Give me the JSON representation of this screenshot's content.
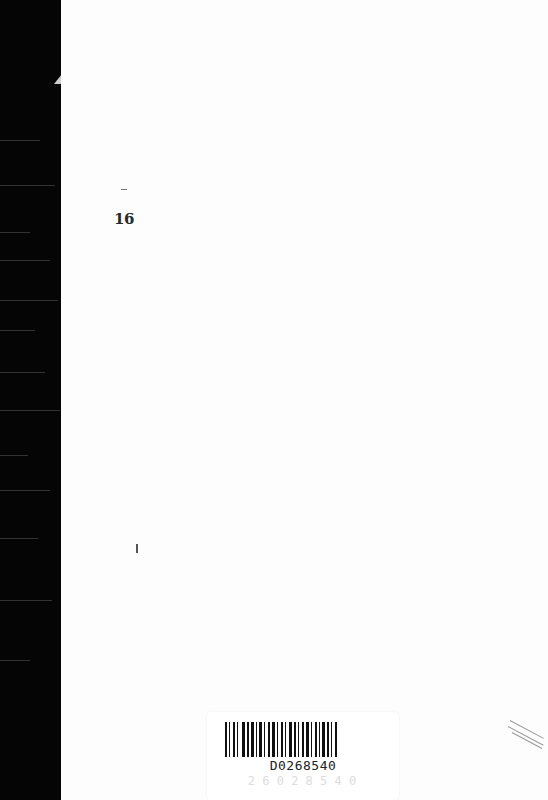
{
  "document": {
    "type": "scanned book page",
    "page_number": "16",
    "barcode": {
      "code": "D0268540",
      "ghost_text": "2 6 0 2 8 5 4 0"
    }
  },
  "colors": {
    "spine": "#050505",
    "page": "#fdfdfd",
    "ink": "#222222"
  }
}
